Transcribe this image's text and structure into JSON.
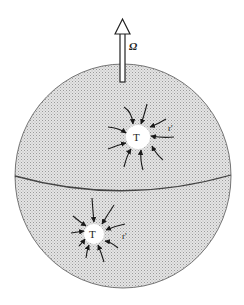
{
  "diagram": {
    "rotation_label": "Ω",
    "vortices": [
      {
        "id": "upper",
        "center_label": "T",
        "radius_label": "r'",
        "hemisphere": "northern"
      },
      {
        "id": "lower",
        "center_label": "T",
        "radius_label": "r'",
        "hemisphere": "southern"
      }
    ],
    "colors": {
      "sphere_fill": "#d6d6d6",
      "outline": "#555555",
      "arrows": "#1a1a1a",
      "core_fill": "#ffffff"
    }
  }
}
